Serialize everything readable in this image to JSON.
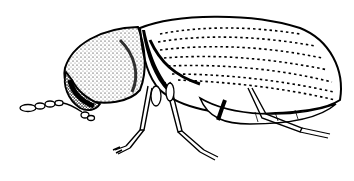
{
  "image": {
    "subject": "beetle illustration",
    "style": "black and white line drawing",
    "background": "#ffffff",
    "ink": "#000000",
    "orientation": "side view, head facing left"
  },
  "parts": [
    {
      "name": "elytra",
      "description": "large oval wing cover with dotted striae"
    },
    {
      "name": "pronotum",
      "description": "stippled rounded thorax shield"
    },
    {
      "name": "head",
      "description": "dark shaded head tucked under pronotum"
    },
    {
      "name": "antenna",
      "description": "segmented antenna extending left"
    },
    {
      "name": "legs",
      "description": "three visible segmented legs"
    },
    {
      "name": "abdomen",
      "description": "visible underside segments"
    }
  ]
}
